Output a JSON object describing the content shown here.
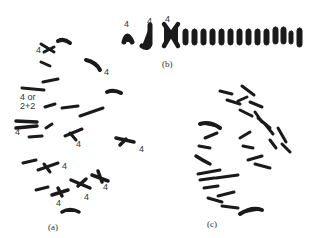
{
  "figure": {
    "panels": [
      {
        "id": "a",
        "caption": "(a)",
        "labels": [
          {
            "text": "4",
            "x": 36,
            "y": 46
          },
          {
            "text": "4",
            "x": 104,
            "y": 68
          },
          {
            "text": "4 or\n2+2",
            "x": 20,
            "y": 93
          },
          {
            "text": "4",
            "x": 15,
            "y": 128
          },
          {
            "text": "4",
            "x": 76,
            "y": 140
          },
          {
            "text": "4",
            "x": 139,
            "y": 145
          },
          {
            "text": "4",
            "x": 62,
            "y": 162
          },
          {
            "text": "4",
            "x": 103,
            "y": 183
          },
          {
            "text": "4",
            "x": 84,
            "y": 193
          },
          {
            "text": "4",
            "x": 56,
            "y": 199
          }
        ]
      },
      {
        "id": "b",
        "caption": "(b)",
        "labels": [
          {
            "text": "4",
            "x": 124,
            "y": 20
          },
          {
            "text": "4",
            "x": 147,
            "y": 17
          },
          {
            "text": "4",
            "x": 165,
            "y": 15
          }
        ]
      },
      {
        "id": "c",
        "caption": "(c)",
        "labels": []
      }
    ],
    "ink_color": "#1a1a1a",
    "label_color": "#333333",
    "background": "#ffffff"
  }
}
